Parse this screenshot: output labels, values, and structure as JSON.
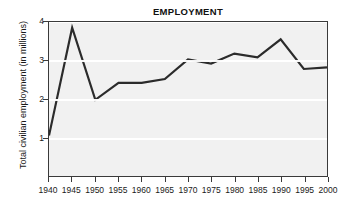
{
  "chart_data": {
    "type": "line",
    "title": "EMPLOYMENT",
    "xlabel": "",
    "ylabel": "Total civilian employment (in millions)",
    "categories": [
      "1940",
      "1945",
      "1950",
      "1955",
      "1960",
      "1965",
      "1970",
      "1975",
      "1980",
      "1985",
      "1990",
      "1995",
      "2000"
    ],
    "x": [
      1940,
      1945,
      1950,
      1955,
      1960,
      1965,
      1970,
      1975,
      1980,
      1985,
      1990,
      1995,
      2000
    ],
    "values": [
      1.05,
      3.85,
      1.98,
      2.42,
      2.42,
      2.52,
      3.03,
      2.92,
      3.18,
      3.08,
      3.55,
      2.78,
      2.82
    ],
    "series": [
      {
        "name": "Total civilian employment",
        "values": [
          1.05,
          3.85,
          1.98,
          2.42,
          2.42,
          2.52,
          3.03,
          2.92,
          3.18,
          3.08,
          3.55,
          2.78,
          2.82
        ]
      }
    ],
    "ylim": [
      0,
      4
    ],
    "xlim": [
      1940,
      2000
    ],
    "yticks": [
      1,
      2,
      3,
      4
    ],
    "ytick_labels": [
      "1",
      "2",
      "3",
      "4"
    ],
    "xticks": [
      1940,
      1945,
      1950,
      1955,
      1960,
      1965,
      1970,
      1975,
      1980,
      1985,
      1990,
      1995,
      2000
    ],
    "grid": true,
    "grid_orientation": "horizontal",
    "grid_color": "#ffffff",
    "plot_background": "#f1f1f1",
    "line_color": "#2b2b2b",
    "line_width": 2.2,
    "legend": null,
    "legend_position": "none",
    "annotations": []
  }
}
